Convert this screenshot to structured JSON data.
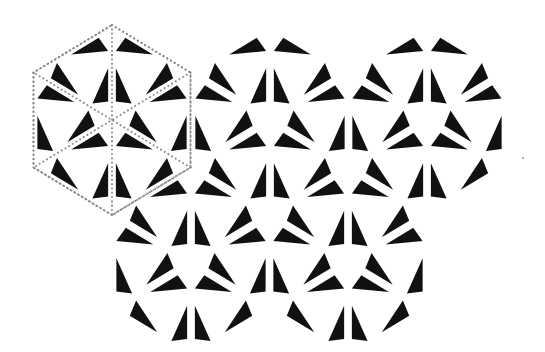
{
  "figure": {
    "background": "#ffffff",
    "fill_color": "#111111",
    "guide_color": "#8a8a8a",
    "hex": {
      "half_width": 78.5,
      "radius": 95
    },
    "hexagons": [
      {
        "id": "top-left",
        "cx": 112,
        "cy": 120,
        "show_guides": true
      },
      {
        "id": "top-middle",
        "cx": 270,
        "cy": 120,
        "show_guides": false
      },
      {
        "id": "top-right",
        "cx": 427,
        "cy": 120,
        "show_guides": false
      },
      {
        "id": "bottom-left",
        "cx": 191,
        "cy": 262.5,
        "show_guides": false
      },
      {
        "id": "bottom-right",
        "cx": 348,
        "cy": 262.5,
        "show_guides": false
      }
    ],
    "pinwheel_barycentric": [
      [
        0.52,
        0.43,
        0.05
      ],
      [
        0.17,
        0.78,
        0.05
      ],
      [
        0.05,
        0.7,
        0.25
      ]
    ],
    "speck": {
      "x": 523,
      "y": 158,
      "r": 1.2
    }
  }
}
